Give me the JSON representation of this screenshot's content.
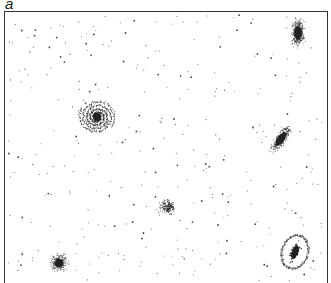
{
  "figure": {
    "panel_label": "a",
    "colors": {
      "ink": "#222222",
      "background": "#ffffff",
      "frame": "#333333"
    },
    "galaxies": [
      {
        "id": "spiral-face-on",
        "type": "spiral",
        "cx": 97,
        "cy": 117,
        "r": 15
      },
      {
        "id": "elongated-top-right",
        "type": "elliptical-elongated",
        "cx": 298,
        "cy": 33,
        "rx": 7,
        "ry": 16,
        "angle": 0
      },
      {
        "id": "edge-on-tilted",
        "type": "lenticular-tilted",
        "cx": 281,
        "cy": 139,
        "rx": 6,
        "ry": 18,
        "angle": 35
      },
      {
        "id": "irregular-center",
        "type": "irregular-diffuse",
        "cx": 168,
        "cy": 207,
        "r": 11
      },
      {
        "id": "elliptical-bottom-left",
        "type": "elliptical-round",
        "cx": 59,
        "cy": 263,
        "r": 12
      },
      {
        "id": "barred-spiral-bottom-right",
        "type": "barred-spiral",
        "cx": 295,
        "cy": 252,
        "rx": 13,
        "ry": 17,
        "angle": 20
      }
    ]
  }
}
